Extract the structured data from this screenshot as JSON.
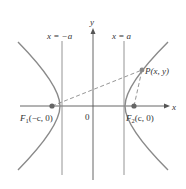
{
  "diagram": {
    "type": "hyperbola",
    "axes": {
      "x_label": "x",
      "y_label": "y",
      "origin_label": "0"
    },
    "asymptote_lines": [
      {
        "label": "x = −a"
      },
      {
        "label": "x = a"
      }
    ],
    "foci": [
      {
        "name": "F",
        "sub": "1",
        "coords": "(−c, 0)"
      },
      {
        "name": "F",
        "sub": "2",
        "coords": "(c, 0)"
      }
    ],
    "point": {
      "label": "P(x, y)"
    },
    "colors": {
      "curve": "#8a8a8a",
      "axis": "#555555",
      "dashed": "#8a8a8a",
      "point": "#777777",
      "text": "#333333"
    }
  }
}
